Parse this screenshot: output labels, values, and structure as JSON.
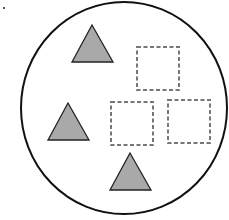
{
  "diagram": {
    "colors": {
      "background": "#ffffff",
      "circle_stroke": "#111111",
      "triangle_fill": "#a9a9a9",
      "triangle_stroke": "#222222",
      "square_stroke": "#777777"
    },
    "dot": {
      "x": 3,
      "y": 7
    },
    "circle": {
      "cx": 124,
      "cy": 108,
      "rx": 103,
      "ry": 106
    },
    "triangles": [
      {
        "points": "92,25 72,62 113,62"
      },
      {
        "points": "68,103 48,140 89,140"
      },
      {
        "points": "130,153 110,190 151,190"
      }
    ],
    "squares": [
      {
        "x": 137,
        "y": 47,
        "w": 42,
        "h": 43
      },
      {
        "x": 111,
        "y": 102,
        "w": 42,
        "h": 43
      },
      {
        "x": 168,
        "y": 100,
        "w": 42,
        "h": 43
      }
    ]
  }
}
